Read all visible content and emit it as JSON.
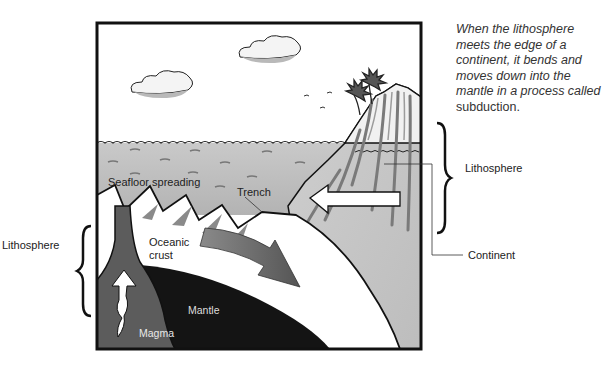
{
  "caption": {
    "italic_text": "When the lithosphere meets the edge of a continent, it bends and moves down into the mantle in a process called",
    "plain_term": "subduction."
  },
  "labels": {
    "seafloor_spreading": "Seafloor spreading",
    "trench": "Trench",
    "oceanic_crust_line1": "Oceanic",
    "oceanic_crust_line2": "crust",
    "mantle": "Mantle",
    "magma": "Magma",
    "lithosphere_right": "Lithosphere",
    "lithosphere_left": "Lithosphere",
    "continent": "Continent"
  },
  "colors": {
    "sky": "#ffffff",
    "ocean": "#bdbdbd",
    "crust": "#ffffff",
    "mantle": "#141414",
    "magma_chamber": "#5c5c5c",
    "arrow_dark": "#6a6a6a",
    "continent_fill": "#c8c8c8",
    "frame": "#111111"
  }
}
